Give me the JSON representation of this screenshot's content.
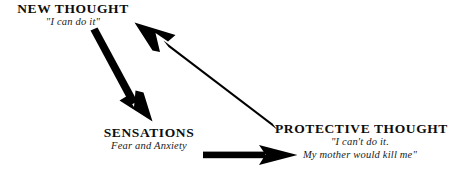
{
  "diagram": {
    "type": "cycle-diagram",
    "background_color": "#ffffff",
    "arrow_color": "#000000",
    "text_color": "#000000",
    "nodes": [
      {
        "id": "new-thought",
        "title": "NEW THOUGHT",
        "subtitle": "\"I can do it\""
      },
      {
        "id": "sensations",
        "title": "SENSATIONS",
        "subtitle": "Fear and Anxiety"
      },
      {
        "id": "protective-thought",
        "title": "PROTECTIVE THOUGHT",
        "subtitle_line1": "\"I can't do it.",
        "subtitle_line2": "My mother would kill me\""
      }
    ],
    "arrows": [
      {
        "id": "new-thought-to-sensations",
        "from": "new-thought",
        "to": "sensations",
        "direction": "down-right"
      },
      {
        "id": "sensations-to-protective-thought",
        "from": "sensations",
        "to": "protective-thought",
        "direction": "right"
      },
      {
        "id": "protective-thought-to-new-thought",
        "from": "protective-thought",
        "to": "new-thought",
        "direction": "up-left"
      }
    ]
  }
}
